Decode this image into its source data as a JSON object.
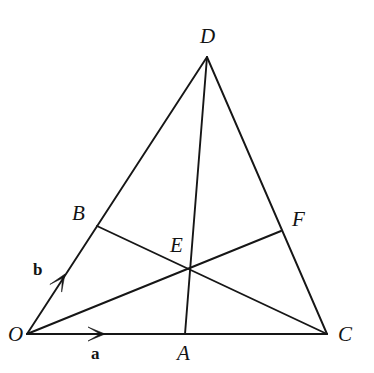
{
  "figure": {
    "background_color": "#ffffff",
    "line_color": "#161616",
    "width": 374,
    "height": 373
  },
  "points": {
    "O": {
      "label": "O",
      "x": 27,
      "y": 334,
      "label_x": 8,
      "label_y": 324
    },
    "C": {
      "label": "C",
      "x": 327,
      "y": 334,
      "label_x": 338,
      "label_y": 324
    },
    "D": {
      "label": "D",
      "x": 207,
      "y": 57,
      "label_x": 200,
      "label_y": 26
    },
    "B": {
      "label": "B",
      "x": 97,
      "y": 226,
      "label_x": 72,
      "label_y": 203
    },
    "F": {
      "label": "F",
      "x": 281,
      "y": 231,
      "label_x": 292,
      "label_y": 209
    },
    "A": {
      "label": "A",
      "x": 185,
      "y": 334,
      "label_x": 177,
      "label_y": 343
    },
    "E": {
      "label": "E",
      "x": 186,
      "y": 270,
      "label_x": 170,
      "label_y": 235
    }
  },
  "segments": [
    {
      "name": "segment-O-C",
      "from": "O",
      "to": "C"
    },
    {
      "name": "segment-O-D",
      "from": "O",
      "to": "D"
    },
    {
      "name": "segment-D-C",
      "from": "D",
      "to": "C"
    },
    {
      "name": "segment-D-A",
      "from": "D",
      "to": "A"
    },
    {
      "name": "segment-O-F",
      "from": "O",
      "to": "F"
    },
    {
      "name": "segment-B-C",
      "from": "B",
      "to": "C"
    }
  ],
  "vectors": [
    {
      "name": "vector-a",
      "label": "a",
      "along": "segment-O-C",
      "tip_x": 105,
      "tip_y": 334,
      "label_x": 91,
      "label_y": 345
    },
    {
      "name": "vector-b",
      "label": "b",
      "along": "segment-O-D",
      "tip_x": 65,
      "tip_y": 274,
      "label_x": 33,
      "label_y": 261
    }
  ]
}
